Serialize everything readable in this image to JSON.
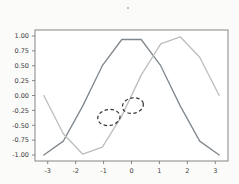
{
  "figure": {
    "title": "",
    "background": "#fbfbfa",
    "plot_background": "#ffffff",
    "spine_color": "#858585",
    "tick_label_color": "#3d3d3d"
  },
  "chart_data": {
    "type": "line",
    "title": "",
    "xlabel": "",
    "ylabel": "",
    "grid": false,
    "legend": null,
    "xlim": [
      -3.456,
      3.456
    ],
    "ylim": [
      -1.1,
      1.1
    ],
    "x": [
      -3.142,
      -2.443,
      -1.745,
      -1.047,
      -0.349,
      0.349,
      1.047,
      1.745,
      2.443,
      3.142
    ],
    "series": [
      {
        "name": "cos-curve",
        "color": "#7f878e",
        "values": [
          -1.0,
          -0.766,
          -0.174,
          0.5,
          0.94,
          0.94,
          0.5,
          -0.174,
          -0.766,
          -1.0
        ]
      },
      {
        "name": "sin-curve",
        "color": "#babfba",
        "values": [
          0.0,
          -0.643,
          -0.985,
          -0.866,
          -0.342,
          0.342,
          0.866,
          0.985,
          0.643,
          0.0
        ]
      }
    ],
    "xticks": [
      -3,
      -2,
      -1,
      0,
      1,
      2,
      3
    ],
    "xtick_labels": [
      "-3",
      "-2",
      "-1",
      "0",
      "1",
      "2",
      "3"
    ],
    "yticks": [
      1.0,
      0.75,
      0.5,
      0.25,
      0.0,
      -0.25,
      -0.5,
      -0.75,
      -1.0
    ],
    "ytick_labels": [
      "1.00",
      "0.75",
      "0.50",
      "0.25",
      "0.00",
      "-0.25",
      "-0.50",
      "-0.75",
      "-1.00"
    ],
    "annotations": [
      {
        "type": "ellipse",
        "style": "dashed",
        "color": "#333333",
        "cx": -0.81,
        "cy": -0.37,
        "rx": 0.4,
        "ry": 0.135,
        "rotation_deg": -8
      },
      {
        "type": "ellipse",
        "style": "dashed",
        "color": "#333333",
        "cx": 0.05,
        "cy": -0.17,
        "rx": 0.38,
        "ry": 0.13,
        "rotation_deg": -12
      }
    ]
  }
}
